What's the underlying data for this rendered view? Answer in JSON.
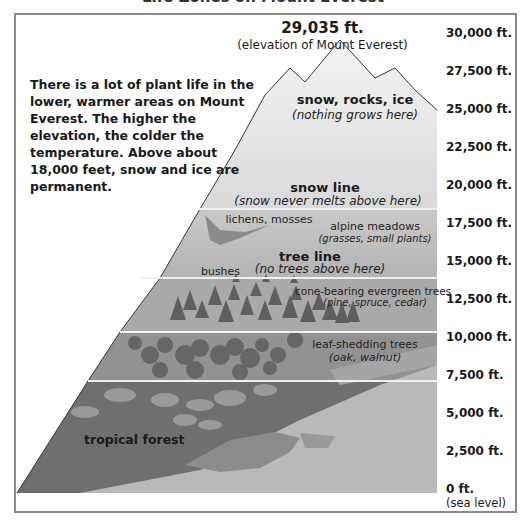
{
  "diagram": {
    "title_partial": "Life Zones on Mount Everest",
    "peak": {
      "elevation": "29,035 ft.",
      "caption": "(elevation of Mount Everest)"
    },
    "intro": "There is a lot of plant life in the lower, warmer areas on Mount Everest. The higher the elevation, the colder the temperature. Above about 18,000 feet, snow and ice are permanent.",
    "axis": {
      "ticks": [
        "30,000 ft.",
        "27,500 ft.",
        "25,000 ft.",
        "22,500 ft.",
        "20,000 ft.",
        "17,500 ft.",
        "15,000 ft.",
        "12,500 ft.",
        "10,000 ft.",
        "7,500 ft.",
        "5,000 ft.",
        "2,500 ft.",
        "0 ft."
      ],
      "base_caption": "(sea level)"
    },
    "zones": {
      "summit": {
        "title": "snow, rocks, ice",
        "note": "(nothing grows here)"
      },
      "snow_line": {
        "title": "snow line",
        "note": "(snow never melts above here)"
      },
      "lichens": {
        "title": "lichens, mosses"
      },
      "alpine": {
        "title": "alpine meadows",
        "note": "(grasses, small plants)"
      },
      "tree_line": {
        "title": "tree line",
        "note": "(no trees above here)"
      },
      "bushes": {
        "title": "bushes"
      },
      "evergreen": {
        "title": "cone-bearing evergreen trees",
        "note": "(pine, spruce, cedar)"
      },
      "deciduous": {
        "title": "leaf-shedding trees",
        "note": "(oak, walnut)"
      },
      "tropical": {
        "title": "tropical forest"
      }
    },
    "colors": {
      "frame": "#8a8a8a",
      "snow": "#f2f2f2",
      "alpine": "#bdbdbd",
      "evergreen": "#a9a9a9",
      "deciduous": "#8f8f8f",
      "tropical": "#6e6e6e",
      "plain": "#b8b8b8",
      "tree": "#5e5e5e"
    }
  }
}
